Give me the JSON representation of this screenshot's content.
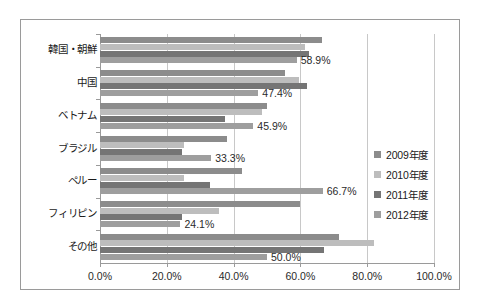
{
  "chart_data": {
    "type": "bar",
    "orientation": "horizontal",
    "title": "",
    "xlabel": "",
    "ylabel": "",
    "xlim": [
      0,
      100
    ],
    "xticks": [
      0,
      20,
      40,
      60,
      80,
      100
    ],
    "xtick_labels": [
      "0.0%",
      "20.0%",
      "40.0%",
      "60.0%",
      "80.0%",
      "100.0%"
    ],
    "grid": true,
    "legend_position": "right",
    "categories": [
      "韓国・朝鮮",
      "中国",
      "ベトナム",
      "ブラジル",
      "ペルー",
      "フィリピン",
      "その他"
    ],
    "series": [
      {
        "name": "2009年度",
        "color": "#8c8c8c",
        "values": [
          66.5,
          55.5,
          50.0,
          38.0,
          42.5,
          60.0,
          71.5
        ]
      },
      {
        "name": "2010年度",
        "color": "#bdbdbd",
        "values": [
          61.5,
          59.5,
          48.5,
          25.0,
          25.0,
          35.5,
          82.0
        ]
      },
      {
        "name": "2011年度",
        "color": "#757575",
        "values": [
          62.5,
          62.0,
          37.5,
          24.5,
          33.0,
          24.5,
          67.0
        ]
      },
      {
        "name": "2012年度",
        "color": "#9e9e9e",
        "values": [
          58.9,
          47.4,
          45.9,
          33.3,
          66.7,
          24.1,
          50.0
        ]
      }
    ],
    "data_labels": {
      "series": "2012年度",
      "values": [
        "58.9%",
        "47.4%",
        "45.9%",
        "33.3%",
        "66.7%",
        "24.1%",
        "50.0%"
      ]
    }
  },
  "legend": {
    "items": [
      {
        "label": "2009年度",
        "color": "#8c8c8c",
        "marker": "square-marker"
      },
      {
        "label": "2010年度",
        "color": "#bdbdbd",
        "marker": "square-marker"
      },
      {
        "label": "2011年度",
        "color": "#757575",
        "marker": "square-marker"
      },
      {
        "label": "2012年度",
        "color": "#9e9e9e",
        "marker": "square-marker"
      }
    ]
  },
  "colors": {
    "frame_border": "#9a9a9a",
    "gridline": "#c8c8c8",
    "axis": "#9a9a9a",
    "text": "#1a1a1a",
    "background": "#ffffff"
  }
}
